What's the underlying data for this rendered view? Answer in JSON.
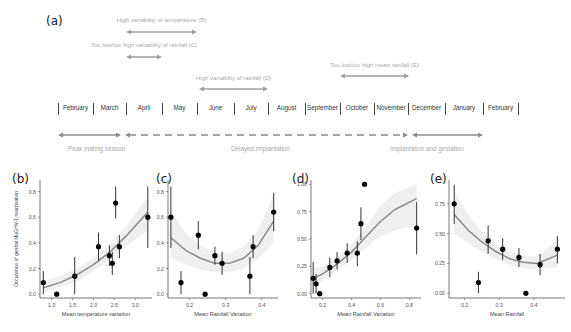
{
  "timeline": {
    "panel_label": "(a)",
    "months": [
      "February",
      "March",
      "April",
      "May",
      "June",
      "July",
      "August",
      "September",
      "October",
      "November",
      "December",
      "January",
      "February"
    ],
    "annotations": [
      {
        "label": "High variability of temperature (B)",
        "x1": 126,
        "x2": 197,
        "y": 32,
        "ty": 17
      },
      {
        "label": "Too low/too high variability of rainfall (C)",
        "x1": 126,
        "x2": 162,
        "y": 57,
        "ty": 42
      },
      {
        "label": "High variability of rainfall (D)",
        "x1": 199,
        "x2": 268,
        "y": 89,
        "ty": 75
      },
      {
        "label": "Too low/too high mean rainfall (E)",
        "x1": 340,
        "x2": 409,
        "y": 76,
        "ty": 62
      }
    ],
    "phases": [
      {
        "label": "Peak mating season",
        "style": "solid",
        "x1": 58,
        "x2": 121,
        "lx": 68
      },
      {
        "label": "Delayed implantation",
        "style": "dashed",
        "x1": 125,
        "x2": 408,
        "lx": 231
      },
      {
        "label": "Implantation and gestation",
        "style": "solid",
        "x1": 412,
        "x2": 483,
        "lx": 390
      }
    ]
  },
  "chart_data": [
    {
      "panel": "(b)",
      "type": "scatter",
      "title": "",
      "xlabel": "Mean temperature variation",
      "ylabel": "Occurence of genital MuGHV-1 reactivation",
      "xlim": [
        0.72,
        3.4
      ],
      "ylim": [
        -0.03,
        0.89
      ],
      "xticks": [
        1.0,
        1.5,
        2.0,
        2.5,
        3.0
      ],
      "xtick_labels": [
        "1.0",
        "1.5",
        "2.0",
        "2.5",
        "3.0"
      ],
      "yticks": [
        0.0,
        0.2,
        0.4,
        0.6,
        0.8
      ],
      "ytick_labels": [
        "0.0",
        "0.2",
        "0.4",
        "0.6",
        "0.8"
      ],
      "points": [
        {
          "x": 0.8,
          "y": 0.09,
          "lo": 0.0,
          "hi": 0.18
        },
        {
          "x": 1.12,
          "y": 0.0
        },
        {
          "x": 1.55,
          "y": 0.14,
          "lo": 0.0,
          "hi": 0.29
        },
        {
          "x": 2.12,
          "y": 0.37,
          "lo": 0.26,
          "hi": 0.48
        },
        {
          "x": 2.38,
          "y": 0.3,
          "lo": 0.22,
          "hi": 0.38
        },
        {
          "x": 2.45,
          "y": 0.24,
          "lo": 0.15,
          "hi": 0.33
        },
        {
          "x": 2.53,
          "y": 0.71,
          "lo": 0.59,
          "hi": 0.84
        },
        {
          "x": 2.62,
          "y": 0.37,
          "lo": 0.28,
          "hi": 0.46
        },
        {
          "x": 3.3,
          "y": 0.6,
          "lo": 0.36,
          "hi": 0.84
        }
      ],
      "fit": {
        "x": [
          0.8,
          1.2,
          1.6,
          2.0,
          2.4,
          2.8,
          3.3
        ],
        "y": [
          0.05,
          0.09,
          0.15,
          0.23,
          0.33,
          0.46,
          0.64
        ]
      },
      "band": {
        "upper": [
          0.1,
          0.14,
          0.2,
          0.28,
          0.39,
          0.54,
          0.76
        ],
        "lower": [
          0.01,
          0.05,
          0.1,
          0.18,
          0.27,
          0.38,
          0.5
        ]
      },
      "box": {
        "left": 40,
        "top": 180,
        "width": 112,
        "height": 118,
        "label_x": 12,
        "label_y": 172
      }
    },
    {
      "panel": "(c)",
      "type": "scatter",
      "title": "",
      "xlabel": "Mean Rainfall Variation",
      "ylabel": "",
      "xlim": [
        0.14,
        0.445
      ],
      "ylim": [
        -0.03,
        0.89
      ],
      "xticks": [
        0.2,
        0.3,
        0.4
      ],
      "xtick_labels": [
        "0.2",
        "0.3",
        "0.4"
      ],
      "yticks": [
        0.0,
        0.2,
        0.4,
        0.6,
        0.8
      ],
      "ytick_labels": [
        "0.0",
        "0.2",
        "0.4",
        "0.6",
        "0.8"
      ],
      "points": [
        {
          "x": 0.148,
          "y": 0.6,
          "lo": 0.36,
          "hi": 0.84
        },
        {
          "x": 0.176,
          "y": 0.09,
          "lo": 0.0,
          "hi": 0.18
        },
        {
          "x": 0.224,
          "y": 0.46,
          "lo": 0.35,
          "hi": 0.57
        },
        {
          "x": 0.243,
          "y": 0.0
        },
        {
          "x": 0.27,
          "y": 0.3,
          "lo": 0.23,
          "hi": 0.37
        },
        {
          "x": 0.29,
          "y": 0.24,
          "lo": 0.15,
          "hi": 0.33
        },
        {
          "x": 0.367,
          "y": 0.14,
          "lo": 0.0,
          "hi": 0.29
        },
        {
          "x": 0.376,
          "y": 0.37,
          "lo": 0.28,
          "hi": 0.46
        },
        {
          "x": 0.433,
          "y": 0.64,
          "lo": 0.49,
          "hi": 0.79
        }
      ],
      "fit": {
        "x": [
          0.148,
          0.19,
          0.23,
          0.27,
          0.31,
          0.35,
          0.39,
          0.433
        ],
        "y": [
          0.44,
          0.34,
          0.28,
          0.24,
          0.24,
          0.28,
          0.38,
          0.57
        ]
      },
      "band": {
        "upper": [
          0.64,
          0.47,
          0.38,
          0.32,
          0.32,
          0.37,
          0.5,
          0.78
        ],
        "lower": [
          0.28,
          0.23,
          0.19,
          0.17,
          0.17,
          0.2,
          0.28,
          0.4
        ]
      },
      "box": {
        "left": 168,
        "top": 180,
        "width": 110,
        "height": 118,
        "label_x": 156,
        "label_y": 172
      }
    },
    {
      "panel": "(d)",
      "type": "scatter",
      "title": "",
      "xlabel": "Mean Rainfall Variation",
      "ylabel": "",
      "xlim": [
        0.12,
        0.88
      ],
      "ylim": [
        -0.04,
        1.04
      ],
      "xticks": [
        0.2,
        0.4,
        0.6,
        0.8
      ],
      "xtick_labels": [
        "0.2",
        "0.4",
        "0.6",
        "0.8"
      ],
      "yticks": [
        0.0,
        0.25,
        0.5,
        0.75,
        1.0
      ],
      "ytick_labels": [
        "0.00",
        "0.25",
        "0.50",
        "0.75",
        "1.00"
      ],
      "points": [
        {
          "x": 0.135,
          "y": 0.14,
          "lo": 0.0,
          "hi": 0.29
        },
        {
          "x": 0.155,
          "y": 0.09,
          "lo": 0.0,
          "hi": 0.18
        },
        {
          "x": 0.18,
          "y": 0.0
        },
        {
          "x": 0.25,
          "y": 0.24,
          "lo": 0.15,
          "hi": 0.33
        },
        {
          "x": 0.3,
          "y": 0.3,
          "lo": 0.22,
          "hi": 0.38
        },
        {
          "x": 0.37,
          "y": 0.37,
          "lo": 0.28,
          "hi": 0.46
        },
        {
          "x": 0.44,
          "y": 0.37,
          "lo": 0.25,
          "hi": 0.48
        },
        {
          "x": 0.465,
          "y": 0.64,
          "lo": 0.49,
          "hi": 0.79
        },
        {
          "x": 0.49,
          "y": 1.0
        },
        {
          "x": 0.85,
          "y": 0.6,
          "lo": 0.36,
          "hi": 0.84
        }
      ],
      "fit": {
        "x": [
          0.135,
          0.2,
          0.3,
          0.4,
          0.5,
          0.6,
          0.7,
          0.85
        ],
        "y": [
          0.14,
          0.18,
          0.27,
          0.38,
          0.52,
          0.66,
          0.77,
          0.87
        ]
      },
      "band": {
        "upper": [
          0.24,
          0.25,
          0.33,
          0.45,
          0.62,
          0.8,
          0.92,
          1.0
        ],
        "lower": [
          0.07,
          0.12,
          0.21,
          0.31,
          0.42,
          0.52,
          0.58,
          0.62
        ]
      },
      "box": {
        "left": 311,
        "top": 180,
        "width": 110,
        "height": 118,
        "label_x": 292,
        "label_y": 172
      }
    },
    {
      "panel": "(e)",
      "type": "scatter",
      "title": "",
      "xlabel": "Mean Rainfall",
      "ylabel": "",
      "xlim": [
        0.155,
        0.49
      ],
      "ylim": [
        -0.04,
        0.95
      ],
      "xticks": [
        0.2,
        0.3,
        0.4
      ],
      "xtick_labels": [
        "0.2",
        "0.3",
        "0.4"
      ],
      "yticks": [
        0.0,
        0.25,
        0.5,
        0.75
      ],
      "ytick_labels": [
        "0.00",
        "0.25",
        "0.50",
        "0.75"
      ],
      "points": [
        {
          "x": 0.17,
          "y": 0.75,
          "lo": 0.58,
          "hi": 0.91
        },
        {
          "x": 0.24,
          "y": 0.09,
          "lo": 0.0,
          "hi": 0.18
        },
        {
          "x": 0.268,
          "y": 0.44,
          "lo": 0.33,
          "hi": 0.57
        },
        {
          "x": 0.31,
          "y": 0.37,
          "lo": 0.28,
          "hi": 0.46
        },
        {
          "x": 0.357,
          "y": 0.3,
          "lo": 0.22,
          "hi": 0.38
        },
        {
          "x": 0.377,
          "y": 0.0
        },
        {
          "x": 0.418,
          "y": 0.24,
          "lo": 0.15,
          "hi": 0.33
        },
        {
          "x": 0.468,
          "y": 0.37,
          "lo": 0.25,
          "hi": 0.48
        }
      ],
      "fit": {
        "x": [
          0.17,
          0.21,
          0.25,
          0.29,
          0.33,
          0.37,
          0.41,
          0.468
        ],
        "y": [
          0.66,
          0.53,
          0.43,
          0.35,
          0.29,
          0.26,
          0.25,
          0.32
        ]
      },
      "band": {
        "upper": [
          0.86,
          0.66,
          0.52,
          0.42,
          0.35,
          0.31,
          0.31,
          0.44
        ],
        "lower": [
          0.5,
          0.42,
          0.35,
          0.29,
          0.24,
          0.21,
          0.2,
          0.22
        ]
      },
      "box": {
        "left": 449,
        "top": 180,
        "width": 116,
        "height": 118,
        "label_x": 430,
        "label_y": 172
      }
    }
  ]
}
